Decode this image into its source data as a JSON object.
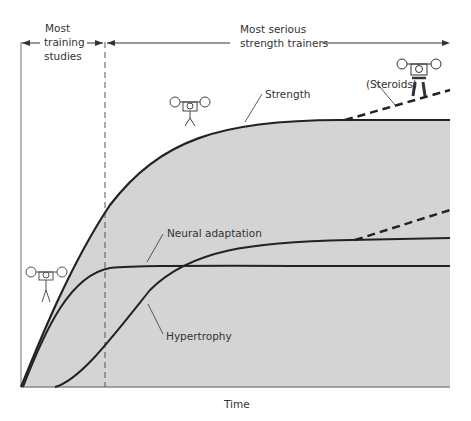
{
  "figure": {
    "xlabel": "Time",
    "phases": [
      {
        "label_lines": [
          "Most",
          "training",
          "studies"
        ]
      },
      {
        "label_lines": [
          "Most serious",
          "strength trainers"
        ]
      }
    ],
    "curves": [
      {
        "name": "Strength",
        "label": "Strength"
      },
      {
        "name": "Neural adaptation",
        "label": "Neural adaptation"
      },
      {
        "name": "Hypertrophy",
        "label": "Hypertrophy"
      },
      {
        "name": "Steroids",
        "label": "(Steroids)"
      }
    ],
    "icons": [
      "weightlifter-small-icon",
      "weightlifter-medium-icon",
      "weightlifter-muscular-icon"
    ],
    "colors": {
      "fill": "#d4d4d4",
      "line": "#222222",
      "axis": "#888888"
    }
  }
}
